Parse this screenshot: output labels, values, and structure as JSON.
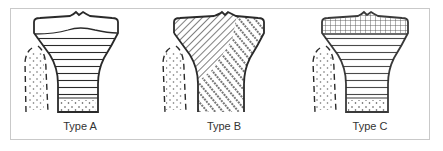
{
  "figure": {
    "panels": [
      {
        "id": "A",
        "label": "Type A",
        "pattern": "horizontal-lines"
      },
      {
        "id": "B",
        "label": "Type B",
        "pattern": "diagonal-hatch-and-dots"
      },
      {
        "id": "C",
        "label": "Type C",
        "pattern": "grid-cap-over-horizontal-lines"
      }
    ]
  },
  "colors": {
    "ink": "#2a2a2a",
    "frame": "#c9c9c9",
    "background": "#ffffff"
  }
}
